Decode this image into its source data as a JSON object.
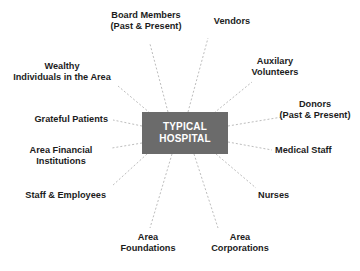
{
  "diagram": {
    "type": "hub-and-spoke",
    "hub": {
      "name": "typical-hospital",
      "line1": "TYPICAL",
      "line2": "HOSPITAL",
      "fill": "#6b6b6b",
      "text_color": "#ffffff"
    },
    "connector": {
      "color": "#bdbdbd",
      "style": "dashed"
    },
    "background": "#ffffff",
    "label_color": "#1c1c1c",
    "nodes": [
      {
        "id": "board-members",
        "lines": [
          "Board Members",
          "(Past & Present)"
        ],
        "align": "center"
      },
      {
        "id": "vendors",
        "lines": [
          "Vendors"
        ],
        "align": "center"
      },
      {
        "id": "auxilary-volunteers",
        "lines": [
          "Auxilary",
          "Volunteers"
        ],
        "align": "center"
      },
      {
        "id": "donors",
        "lines": [
          "Donors",
          "(Past & Present)"
        ],
        "align": "center"
      },
      {
        "id": "medical-staff",
        "lines": [
          "Medical Staff"
        ],
        "align": "left"
      },
      {
        "id": "nurses",
        "lines": [
          "Nurses"
        ],
        "align": "left"
      },
      {
        "id": "area-corporations",
        "lines": [
          "Area",
          "Corporations"
        ],
        "align": "center"
      },
      {
        "id": "area-foundations",
        "lines": [
          "Area",
          "Foundations"
        ],
        "align": "center"
      },
      {
        "id": "staff-and-employees",
        "lines": [
          "Staff & Employees"
        ],
        "align": "right"
      },
      {
        "id": "area-financial-institutions",
        "lines": [
          "Area Financial",
          "Institutions"
        ],
        "align": "center"
      },
      {
        "id": "grateful-patients",
        "lines": [
          "Grateful Patients"
        ],
        "align": "right"
      },
      {
        "id": "wealthy-individuals",
        "lines": [
          "Wealthy",
          "Individuals in the Area"
        ],
        "align": "center"
      }
    ]
  }
}
